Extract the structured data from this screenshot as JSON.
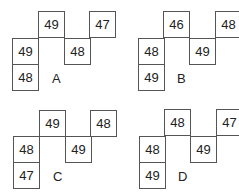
{
  "panels": [
    {
      "label": "A",
      "top_left": "49",
      "top_right": "47",
      "mid_left": "49",
      "mid_right": "48",
      "bottom": "48"
    },
    {
      "label": "B",
      "top_left": "46",
      "top_right": "48",
      "mid_left": "48",
      "mid_right": "49",
      "bottom": "49"
    },
    {
      "label": "C",
      "top_left": "49",
      "top_right": "48",
      "mid_left": "48",
      "mid_right": "49",
      "bottom": "47"
    },
    {
      "label": "D",
      "top_left": "48",
      "top_right": "47",
      "mid_left": "48",
      "mid_right": "49",
      "bottom": "49"
    }
  ]
}
